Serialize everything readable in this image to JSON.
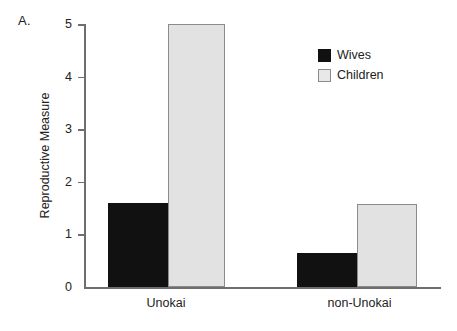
{
  "panel": {
    "label": "A."
  },
  "chart_data": {
    "type": "bar",
    "title": "",
    "xlabel": "",
    "ylabel": "Reproductive Measure",
    "categories": [
      "Unokai",
      "non-Unokai"
    ],
    "series": [
      {
        "name": "Wives",
        "color": "#111111",
        "values": [
          1.6,
          0.65
        ]
      },
      {
        "name": "Children",
        "color": "#e2e2e2",
        "values": [
          5.0,
          1.58
        ]
      }
    ],
    "ylim": [
      0,
      5
    ],
    "yticks": [
      0,
      1,
      2,
      3,
      4,
      5
    ],
    "ytick_labels": [
      "0",
      "1",
      "2",
      "3",
      "4",
      "5"
    ],
    "grid": false,
    "legend_position": "top-right"
  },
  "legend": {
    "items": [
      {
        "label": "Wives"
      },
      {
        "label": "Children"
      }
    ]
  },
  "axis": {
    "y_title": "Reproductive Measure",
    "tick_0": "0",
    "tick_1": "1",
    "tick_2": "2",
    "tick_3": "3",
    "tick_4": "4",
    "tick_5": "5",
    "x_cat_0": "Unokai",
    "x_cat_1": "non-Unokai"
  }
}
